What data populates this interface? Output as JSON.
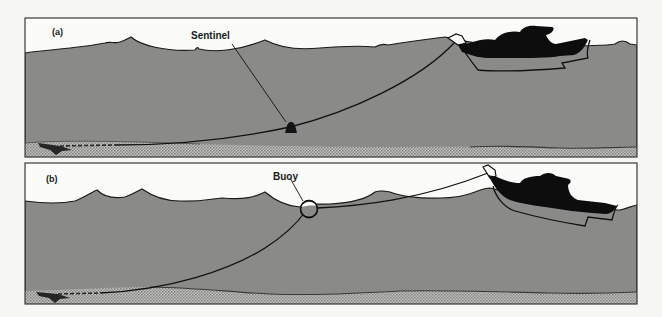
{
  "figure": {
    "colors": {
      "background": "#f7f7f5",
      "sky": "#fbfbf9",
      "water": "#8a8a88",
      "seabed": "#b9b9b6",
      "ink": "#111111",
      "frame": "#3a3a3a"
    },
    "panels": [
      {
        "id": "a",
        "label": "(a)",
        "callout": "Sentinel",
        "device_icon": "sentinel-weight-icon"
      },
      {
        "id": "b",
        "label": "(b)",
        "callout": "Buoy",
        "device_icon": "buoy-icon"
      }
    ]
  }
}
